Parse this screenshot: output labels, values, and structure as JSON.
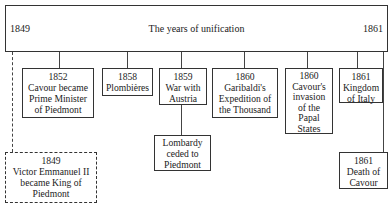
{
  "header": {
    "start_year": "1849",
    "title": "The years of unification",
    "end_year": "1861"
  },
  "events": [
    {
      "id": "cavour-pm",
      "year": "1852",
      "lines": [
        "Cavour became",
        "Prime Minister",
        "of Piedmont"
      ]
    },
    {
      "id": "plombieres",
      "year": "1858",
      "lines": [
        "Plombières"
      ]
    },
    {
      "id": "war-austria",
      "year": "1859",
      "lines": [
        "War with",
        "Austria"
      ]
    },
    {
      "id": "garibaldi",
      "year": "1860",
      "lines": [
        "Garibaldi's",
        "Expedition of",
        "the Thousand"
      ]
    },
    {
      "id": "cavour-invasion",
      "year": "1860",
      "lines": [
        "Cavour's",
        "invasion",
        "of the",
        "Papal",
        "States"
      ]
    },
    {
      "id": "kingdom-italy",
      "year": "1861",
      "lines": [
        "Kingdom",
        "of Italy"
      ]
    }
  ],
  "sub_events": [
    {
      "id": "lombardy",
      "parent": "war-austria",
      "lines": [
        "Lombardy",
        "ceded to",
        "Piedmont"
      ]
    },
    {
      "id": "death-cavour",
      "parent": "end",
      "year": "1861",
      "lines": [
        "Death of",
        "Cavour"
      ]
    }
  ],
  "dashed_event": {
    "year": "1849",
    "lines": [
      "Victor Emmanuel II",
      "became King of",
      "Piedmont"
    ]
  }
}
